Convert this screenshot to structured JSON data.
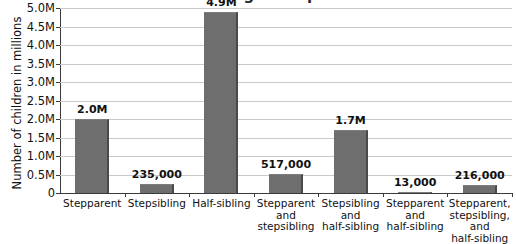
{
  "chart_data": {
    "type": "bar",
    "title": "Children living in stepfamilies",
    "title_note": "cropped at top edge of screenshot",
    "xlabel": "",
    "ylabel": "Number of children in millions",
    "ylim": [
      0,
      5000000
    ],
    "grid": true,
    "legend": "none",
    "categories": [
      "Stepparent",
      "Stepsibling",
      "Half-sibling",
      "Stepparent and stepsibling",
      "Stepsibling and half-sibling",
      "Stepparent and half-sibling",
      "Stepparent, stepsibling, and half-sibling"
    ],
    "category_lines": [
      [
        "Stepparent"
      ],
      [
        "Stepsibling"
      ],
      [
        "Half-sibling"
      ],
      [
        "Stepparent",
        "and",
        "stepsibling"
      ],
      [
        "Stepsibling",
        "and",
        "half-sibling"
      ],
      [
        "Stepparent",
        "and",
        "half-sibling"
      ],
      [
        "Stepparent,",
        "stepsibling,",
        "and",
        "half-sibling"
      ]
    ],
    "values": [
      2000000,
      235000,
      4900000,
      517000,
      1700000,
      13000,
      216000
    ],
    "value_labels": [
      "2.0M",
      "235,000",
      "4.9M",
      "517,000",
      "1.7M",
      "13,000",
      "216,000"
    ],
    "ytick_values": [
      0,
      500000,
      1000000,
      1500000,
      2000000,
      2500000,
      3000000,
      3500000,
      4000000,
      4500000,
      5000000
    ],
    "ytick_labels": [
      "0",
      "0.5M",
      "1.0M",
      "1.5M",
      "2.0M",
      "2.5M",
      "3.0M",
      "3.5M",
      "4.0M",
      "4.5M",
      "5.0M"
    ],
    "bar_color": "#6e6e6e",
    "bar_edge_color": "#4a4a4a",
    "grid_color": "#c9c9c9",
    "axis_color": "#3a3a3a"
  }
}
